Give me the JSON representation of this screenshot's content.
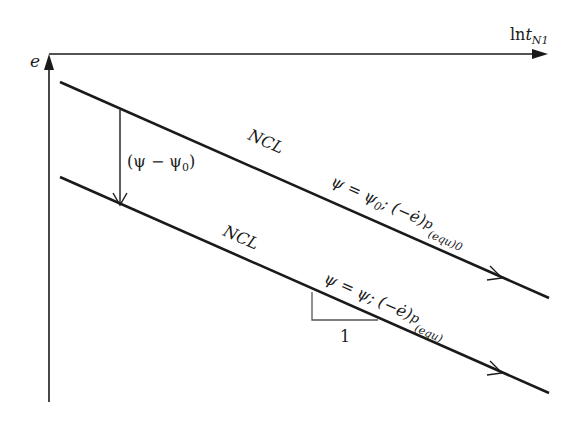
{
  "diagram": {
    "type": "ncl-schematic",
    "colors": {
      "line": "#1a1a1a",
      "background": "#ffffff"
    },
    "axes": {
      "y_label": "e",
      "x_label_main": "ln",
      "x_label_var": "t",
      "x_label_sub": "N1"
    },
    "shift_arrow": {
      "label": "(ψ − ψ",
      "label_sub": "0",
      "label_close": ")"
    },
    "upper_line": {
      "name": "NCL",
      "eq_main": "ψ = ψ",
      "eq_sub0": "0",
      "eq_rest": "; (−ė)",
      "eq_sup": "p",
      "eq_subscript": "(equ)0"
    },
    "lower_line": {
      "name": "NCL",
      "eq_main": "ψ = ψ; (−ė)",
      "eq_sup": "p",
      "eq_subscript": "(equ)"
    },
    "slope_triangle": {
      "run_label": "1"
    }
  }
}
